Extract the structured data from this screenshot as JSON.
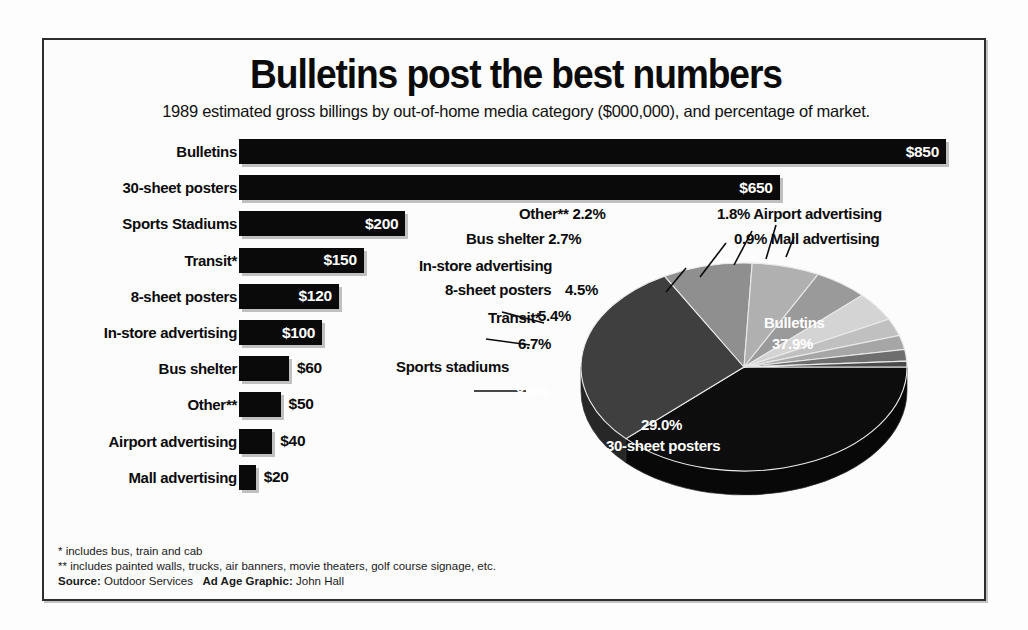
{
  "headline": "Bulletins post the best numbers",
  "subhead": "1989 estimated gross billings by out-of-home media category ($000,000), and percentage of market.",
  "footnotes": {
    "single_star": "* includes bus, train and cab",
    "double_star": "** includes painted walls, trucks, air banners, movie theaters, golf course signage, etc.",
    "source_label": "Source:",
    "source_value": "Outdoor Services",
    "credit_label": "Ad Age Graphic:",
    "credit_value": "John Hall"
  },
  "bar_labels": [
    "Bulletins",
    "30-sheet posters",
    "Sports Stadiums",
    "Transit*",
    "8-sheet posters",
    "In-store advertising",
    "Bus shelter",
    "Other**",
    "Airport advertising",
    "Mall advertising"
  ],
  "bar_values": [
    "$850",
    "$650",
    "$200",
    "$150",
    "$120",
    "$100",
    "$60",
    "$50",
    "$40",
    "$20"
  ],
  "pie_callouts": [
    "Other**  2.2%",
    "1.8%  Airport advertising",
    "Bus shelter  2.7%",
    "0.9%  Mall advertising",
    "In-store advertising",
    "8-sheet posters",
    "Transit*",
    "Sports stadiums"
  ],
  "pie_inlabels": {
    "instore": "4.5%",
    "eightsheet": "5.4%",
    "transit": "6.7%",
    "sports": "8.9%",
    "bulletins_name": "Bulletins",
    "bulletins_pct": "37.9%",
    "thirtysheet_pct": "29.0%",
    "thirtysheet_name": "30-sheet posters"
  },
  "colors": {
    "ink": "#0a0a0a",
    "frame": "#2e2e2e",
    "paper": "#fcfcfc",
    "slice_bulletins": "#0d0d0d",
    "slice_30sheet": "#3f3f3f",
    "slice_sports": "#8f8f8f",
    "slice_transit": "#b0b0b0",
    "slice_8sheet": "#9a9a9a",
    "slice_instore": "#d4d4d4",
    "slice_busshelter": "#c0c0c0",
    "slice_other": "#a6a6a6",
    "slice_airport": "#6e6e6e",
    "slice_mall": "#4a4a4a"
  },
  "chart_data": [
    {
      "type": "bar",
      "title": "Bulletins post the best numbers",
      "subtitle": "1989 estimated gross billings by out-of-home media category ($000,000), and percentage of market.",
      "orientation": "horizontal",
      "xlabel": "",
      "ylabel": "",
      "xlim": [
        0,
        850
      ],
      "grid": false,
      "categories": [
        "Bulletins",
        "30-sheet posters",
        "Sports Stadiums",
        "Transit*",
        "8-sheet posters",
        "In-store advertising",
        "Bus shelter",
        "Other**",
        "Airport advertising",
        "Mall advertising"
      ],
      "values": [
        850,
        650,
        200,
        150,
        120,
        100,
        60,
        50,
        40,
        20
      ],
      "data_labels": [
        "$850",
        "$650",
        "$200",
        "$150",
        "$120",
        "$100",
        "$60",
        "$50",
        "$40",
        "$20"
      ],
      "units": "$000,000"
    },
    {
      "type": "pie",
      "title": "",
      "three_d": true,
      "legend": "callout labels",
      "categories": [
        "Bulletins",
        "30-sheet posters",
        "Sports stadiums",
        "Transit*",
        "8-sheet posters",
        "In-store advertising",
        "Bus shelter",
        "Other**",
        "Airport advertising",
        "Mall advertising"
      ],
      "values": [
        37.9,
        29.0,
        8.9,
        6.7,
        5.4,
        4.5,
        2.7,
        2.2,
        1.8,
        0.9
      ],
      "data_labels": [
        "37.9%",
        "29.0%",
        "8.9%",
        "6.7%",
        "5.4%",
        "4.5%",
        "2.7%",
        "2.2%",
        "1.8%",
        "0.9%"
      ],
      "units": "percent of market"
    }
  ]
}
